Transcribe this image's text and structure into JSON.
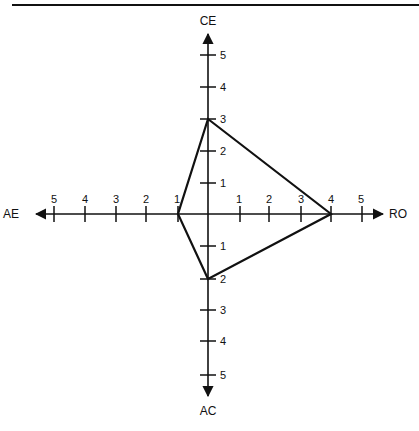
{
  "diagram": {
    "type": "four-axis kite / quadrilateral plot",
    "colors": {
      "line": "#111111",
      "background": "#ffffff"
    },
    "axes": {
      "top": {
        "label": "CE",
        "ticks": [
          "1",
          "2",
          "3",
          "4",
          "5"
        ]
      },
      "right": {
        "label": "RO",
        "ticks": [
          "1",
          "2",
          "3",
          "4",
          "5"
        ]
      },
      "bottom": {
        "label": "AC",
        "ticks": [
          "1",
          "2",
          "3",
          "4",
          "5"
        ]
      },
      "left": {
        "label": "AE",
        "ticks": [
          "1",
          "2",
          "3",
          "4",
          "5"
        ]
      }
    },
    "profile": {
      "CE": 3,
      "RO": 4,
      "AC": 2,
      "AE": 1
    }
  }
}
